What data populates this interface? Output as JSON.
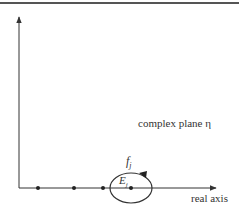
{
  "diagram": {
    "plane_label": "complex plane η",
    "real_axis_label": "real axis",
    "contour_label": {
      "base": "f",
      "sub": "j"
    },
    "point_label": {
      "base": "E",
      "sub": "j"
    },
    "real_axis_points_count": 4,
    "contour_direction": "counterclockwise",
    "colors": {
      "line": "#333333",
      "border": "#555555",
      "background": "#ffffff"
    }
  }
}
